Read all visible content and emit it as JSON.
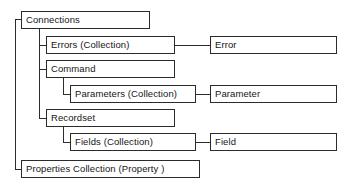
{
  "diagram": {
    "type": "tree-hierarchy",
    "line_color": "#2b2b2b",
    "box_fill": "#ffffff",
    "text_color": "#151515",
    "nodes": [
      {
        "id": "connections",
        "label": "Connections",
        "level": 1,
        "x": 21,
        "y": 11,
        "w": 129,
        "h": 18
      },
      {
        "id": "errors-collection",
        "label": "Errors (Collection)",
        "level": 2,
        "x": 46,
        "y": 36,
        "w": 129,
        "h": 18
      },
      {
        "id": "error",
        "label": "Error",
        "level": 3,
        "x": 210,
        "y": 36,
        "w": 127,
        "h": 18
      },
      {
        "id": "command",
        "label": "Command",
        "level": 2,
        "x": 46,
        "y": 60,
        "w": 129,
        "h": 18
      },
      {
        "id": "parameters-collection",
        "label": "Parameters (Collection)",
        "level": 3,
        "x": 70,
        "y": 85,
        "w": 126,
        "h": 18
      },
      {
        "id": "parameter",
        "label": "Parameter",
        "level": 4,
        "x": 210,
        "y": 85,
        "w": 127,
        "h": 18
      },
      {
        "id": "recordset",
        "label": "Recordset",
        "level": 2,
        "x": 46,
        "y": 109,
        "w": 129,
        "h": 18
      },
      {
        "id": "fields-collection",
        "label": "Fields (Collection)",
        "level": 3,
        "x": 70,
        "y": 133,
        "w": 126,
        "h": 18
      },
      {
        "id": "field",
        "label": "Field",
        "level": 4,
        "x": 210,
        "y": 133,
        "w": 127,
        "h": 18
      },
      {
        "id": "properties-collection",
        "label": "Properties Collection (Property )",
        "level": 2,
        "x": 21,
        "y": 160,
        "w": 179,
        "h": 18
      }
    ]
  }
}
